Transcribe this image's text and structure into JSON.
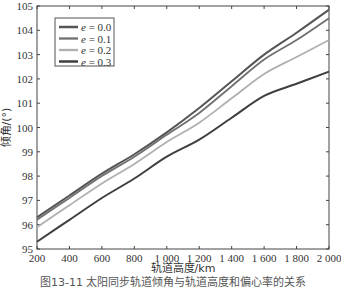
{
  "chart_data": {
    "type": "line",
    "title": "",
    "xlabel": "轨道高度/km",
    "ylabel": "倾角/(°)",
    "xlim": [
      200,
      2000
    ],
    "ylim": [
      95,
      105
    ],
    "grid": false,
    "legend_position": "upper-left",
    "x": [
      200,
      400,
      600,
      800,
      1000,
      1200,
      1400,
      1600,
      1800,
      2000
    ],
    "x_tick_labels": [
      "200",
      "400",
      "600",
      "800",
      "1 000",
      "1 200",
      "1 400",
      "1 600",
      "1 800",
      "2 000"
    ],
    "y_ticks": [
      95,
      96,
      97,
      98,
      99,
      100,
      101,
      102,
      103,
      104,
      105
    ],
    "series": [
      {
        "name": "e = 0.0",
        "color": "#555555",
        "width": 2.0,
        "values": [
          96.3,
          97.2,
          98.1,
          98.9,
          99.8,
          100.8,
          101.9,
          103.0,
          103.9,
          104.85
        ]
      },
      {
        "name": "e = 0.1",
        "color": "#707070",
        "width": 1.8,
        "values": [
          96.2,
          97.1,
          98.0,
          98.8,
          99.7,
          100.6,
          101.7,
          102.8,
          103.6,
          104.5
        ]
      },
      {
        "name": "e = 0.2",
        "color": "#b0b0b0",
        "width": 1.8,
        "values": [
          95.9,
          96.8,
          97.7,
          98.5,
          99.4,
          100.2,
          101.2,
          102.2,
          102.9,
          103.6
        ]
      },
      {
        "name": "e = 0.3",
        "color": "#3f3f3f",
        "width": 2.0,
        "values": [
          95.3,
          96.2,
          97.1,
          97.9,
          98.8,
          99.5,
          100.4,
          101.3,
          101.8,
          102.3
        ]
      }
    ]
  },
  "caption": "图13-11  太阳同步轨道倾角与轨道高度和偏心率的关系"
}
